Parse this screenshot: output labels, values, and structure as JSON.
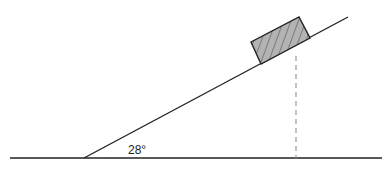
{
  "diagram": {
    "type": "inclined-plane",
    "angle_label": "28°",
    "colors": {
      "line": "#222222",
      "block_fill": "#b3b3b3",
      "hatch": "#444444",
      "dashed": "#999999",
      "background": "#ffffff"
    },
    "elements": {
      "ground": "horizontal ground line",
      "incline": "inclined plane surface",
      "block": "hatched block resting on incline",
      "drop_line": "dashed vertical line from block to ground"
    }
  }
}
